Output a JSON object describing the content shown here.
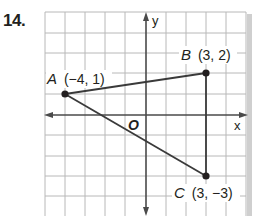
{
  "problem": {
    "number": "14."
  },
  "graph": {
    "x_axis_label": "x",
    "y_axis_label": "y",
    "origin_label": "O",
    "grid": {
      "x_min": -5,
      "x_max": 5,
      "y_min": -5,
      "y_max": 5,
      "spacing_px": 20.2,
      "origin_px": [
        146,
        115
      ]
    },
    "colors": {
      "grid": "#b8b8b8",
      "axis": "#4a4a4a",
      "segment": "#3a3a3a",
      "point": "#231f20",
      "shadow": "#c8c8c8"
    }
  },
  "points": [
    {
      "letter": "A",
      "coords": "(−4, 1)",
      "x": -4,
      "y": 1
    },
    {
      "letter": "B",
      "coords": "(3, 2)",
      "x": 3,
      "y": 2
    },
    {
      "letter": "C",
      "coords": "(3, −3)",
      "x": 3,
      "y": -3
    }
  ],
  "segments": [
    [
      "A",
      "B"
    ],
    [
      "B",
      "C"
    ],
    [
      "A",
      "C"
    ]
  ]
}
